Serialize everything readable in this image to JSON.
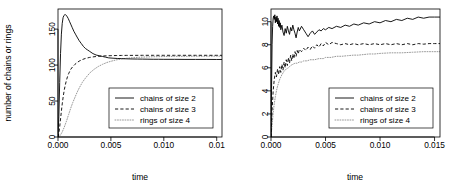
{
  "figure": {
    "panel_count": 2,
    "background": "#ffffff",
    "ink_color": "#000000",
    "dotted_color": "#8c8c8c"
  },
  "chart_data": [
    {
      "type": "line",
      "panel": "left",
      "title": "",
      "xlabel": "time",
      "ylabel": "number of chains or rings",
      "xlim": [
        0,
        0.0155
      ],
      "ylim": [
        0,
        178
      ],
      "grid": false,
      "legend_position": "center-right",
      "xticks": [
        0.0,
        0.005,
        0.01,
        0.015
      ],
      "xticklabels": [
        "0.000",
        "0.005",
        "0.010",
        "0.01"
      ],
      "yticks": [
        0,
        50,
        100,
        150
      ],
      "yticklabels": [
        "0",
        "50",
        "100",
        "150"
      ],
      "series": [
        {
          "name": "chains of size 2",
          "style": "solid",
          "x": [
            0.0,
            8e-05,
            0.00016,
            0.00024,
            0.00032,
            0.0004,
            0.00048,
            0.00056,
            0.00064,
            0.00072,
            0.0008,
            0.00088,
            0.00096,
            0.00108,
            0.0012,
            0.00135,
            0.0015,
            0.00165,
            0.0018,
            0.002,
            0.0022,
            0.0024,
            0.0026,
            0.0028,
            0.003,
            0.0033,
            0.0036,
            0.0039,
            0.0042,
            0.0045,
            0.0048,
            0.0052,
            0.0056,
            0.006,
            0.0065,
            0.007,
            0.0075,
            0.008,
            0.0085,
            0.009,
            0.0095,
            0.01,
            0.011,
            0.012,
            0.013,
            0.014,
            0.015,
            0.0155
          ],
          "y": [
            2,
            28,
            76,
            116,
            143,
            158,
            166,
            169,
            170,
            170,
            169,
            167,
            165,
            161,
            157,
            152,
            147,
            143,
            139,
            134,
            130,
            126,
            123,
            121,
            119,
            116,
            114,
            113,
            112,
            111,
            110,
            109.6,
            109.2,
            109.0,
            108.7,
            108.5,
            108.4,
            108.3,
            108.2,
            108.1,
            108.1,
            108.0,
            108.0,
            107.9,
            107.9,
            107.9,
            107.8,
            107.8
          ]
        },
        {
          "name": "chains of size 3",
          "style": "dashed",
          "x": [
            0.0,
            8e-05,
            0.00016,
            0.00024,
            0.00032,
            0.0004,
            0.0005,
            0.0006,
            0.0007,
            0.0008,
            0.0009,
            0.001,
            0.0012,
            0.0014,
            0.0016,
            0.0018,
            0.002,
            0.0023,
            0.0026,
            0.003,
            0.0034,
            0.0038,
            0.0042,
            0.0046,
            0.005,
            0.0055,
            0.006,
            0.0065,
            0.007,
            0.008,
            0.009,
            0.01,
            0.011,
            0.012,
            0.013,
            0.014,
            0.015,
            0.0155
          ],
          "y": [
            0,
            5,
            14,
            25,
            36,
            46,
            57,
            66,
            73,
            79,
            84,
            88,
            94,
            98,
            101,
            103.5,
            105.5,
            107.7,
            109.3,
            110.7,
            111.6,
            112.2,
            112.6,
            112.9,
            113.1,
            113.3,
            113.4,
            113.5,
            113.5,
            113.6,
            113.6,
            113.6,
            113.6,
            113.6,
            113.6,
            113.6,
            113.6,
            113.6
          ]
        },
        {
          "name": "rings of size 4",
          "style": "dotted",
          "x": [
            0.0,
            0.0002,
            0.0004,
            0.0006,
            0.0008,
            0.001,
            0.0012,
            0.0014,
            0.0016,
            0.0018,
            0.002,
            0.0023,
            0.0026,
            0.003,
            0.0034,
            0.0038,
            0.0042,
            0.0046,
            0.005,
            0.0055,
            0.006,
            0.0065,
            0.007,
            0.0076,
            0.008,
            0.009,
            0.01,
            0.011,
            0.012,
            0.013,
            0.014,
            0.015,
            0.0155
          ],
          "y": [
            0,
            2,
            7,
            14,
            22,
            31,
            40,
            48,
            55,
            62,
            68,
            76,
            82,
            89,
            94,
            98,
            101,
            103.5,
            105.3,
            107.2,
            108.5,
            109.5,
            110.2,
            110.8,
            111.1,
            111.6,
            111.9,
            112.1,
            112.2,
            112.3,
            112.3,
            112.4,
            112.4
          ]
        }
      ],
      "legend": [
        {
          "label": "chains of size 2",
          "style": "solid"
        },
        {
          "label": "chains of size 3",
          "style": "dashed"
        },
        {
          "label": "rings of size 4",
          "style": "dotted"
        }
      ]
    },
    {
      "type": "line",
      "panel": "right",
      "title": "",
      "xlabel": "time",
      "ylabel": "",
      "xlim": [
        0,
        0.0155
      ],
      "ylim": [
        0,
        11.1
      ],
      "grid": false,
      "legend_position": "center-right",
      "xticks": [
        0.0,
        0.005,
        0.01,
        0.015
      ],
      "xticklabels": [
        "0.000",
        "0.005",
        "0.010",
        "0.015"
      ],
      "yticks": [
        0,
        2,
        4,
        6,
        8,
        10
      ],
      "yticklabels": [
        "0",
        "2",
        "4",
        "6",
        "8",
        "10"
      ],
      "series": [
        {
          "name": "chains of size 2",
          "style": "solid",
          "x": [
            0.0,
            5e-05,
            0.0001,
            0.00015,
            0.0002,
            0.00025,
            0.0003,
            0.00035,
            0.0004,
            0.00045,
            0.0005,
            0.00055,
            0.0006,
            0.00065,
            0.0007,
            0.00075,
            0.0008,
            0.00085,
            0.0009,
            0.001,
            0.0011,
            0.0012,
            0.0013,
            0.0014,
            0.0015,
            0.0016,
            0.0017,
            0.0018,
            0.0019,
            0.002,
            0.0021,
            0.0022,
            0.0023,
            0.0024,
            0.0025,
            0.0026,
            0.0028,
            0.003,
            0.0032,
            0.0034,
            0.0036,
            0.0038,
            0.004,
            0.0042,
            0.0044,
            0.0046,
            0.0048,
            0.005,
            0.0053,
            0.0056,
            0.006,
            0.0064,
            0.0068,
            0.0072,
            0.0076,
            0.008,
            0.0085,
            0.009,
            0.0095,
            0.01,
            0.0105,
            0.011,
            0.0115,
            0.012,
            0.0125,
            0.013,
            0.0135,
            0.014,
            0.0145,
            0.015,
            0.0155
          ],
          "y": [
            0,
            4.2,
            8.0,
            9.6,
            10.3,
            10.5,
            10.2,
            10.6,
            9.9,
            10.4,
            10.0,
            10.5,
            9.8,
            10.3,
            9.6,
            10.1,
            9.5,
            9.9,
            9.3,
            9.7,
            9.1,
            8.8,
            9.4,
            9.0,
            9.6,
            9.2,
            8.9,
            9.5,
            9.2,
            9.7,
            9.3,
            9.0,
            8.6,
            9.1,
            9.5,
            9.2,
            9.6,
            9.3,
            9.0,
            8.7,
            9.0,
            9.2,
            8.9,
            9.1,
            9.3,
            9.2,
            9.4,
            9.3,
            9.5,
            9.4,
            9.6,
            9.5,
            9.7,
            9.6,
            9.8,
            9.7,
            9.9,
            9.8,
            10.0,
            9.9,
            10.1,
            10.0,
            10.2,
            10.1,
            10.3,
            10.2,
            10.4,
            10.3,
            10.4,
            10.4,
            10.4
          ]
        },
        {
          "name": "chains of size 3",
          "style": "dashed",
          "x": [
            0.0,
            0.0001,
            0.0002,
            0.0003,
            0.0004,
            0.0005,
            0.0006,
            0.0007,
            0.0008,
            0.0009,
            0.001,
            0.0011,
            0.0012,
            0.0013,
            0.0014,
            0.0015,
            0.0016,
            0.0017,
            0.0018,
            0.0019,
            0.002,
            0.0021,
            0.0022,
            0.0023,
            0.0024,
            0.0025,
            0.0026,
            0.0028,
            0.003,
            0.0032,
            0.0034,
            0.0036,
            0.0038,
            0.004,
            0.0042,
            0.0044,
            0.0046,
            0.0048,
            0.005,
            0.0053,
            0.0056,
            0.006,
            0.0064,
            0.0068,
            0.0072,
            0.0076,
            0.008,
            0.0085,
            0.009,
            0.0095,
            0.01,
            0.0105,
            0.011,
            0.0115,
            0.012,
            0.0125,
            0.013,
            0.0135,
            0.014,
            0.0145,
            0.015,
            0.0155
          ],
          "y": [
            0,
            2.3,
            4.0,
            5.0,
            5.6,
            5.2,
            5.9,
            5.4,
            6.1,
            5.6,
            6.3,
            5.8,
            6.5,
            6.0,
            6.7,
            6.2,
            6.9,
            6.4,
            7.1,
            6.6,
            7.2,
            6.8,
            7.4,
            7.0,
            7.5,
            7.2,
            7.6,
            7.4,
            7.7,
            7.5,
            7.8,
            7.6,
            7.9,
            7.7,
            8.0,
            7.8,
            8.1,
            7.9,
            8.2,
            8.0,
            8.2,
            8.1,
            8.0,
            8.1,
            8.0,
            8.1,
            8.0,
            8.1,
            8.0,
            8.1,
            8.0,
            8.1,
            8.0,
            8.1,
            8.0,
            8.1,
            8.0,
            8.1,
            8.05,
            8.1,
            8.1,
            8.1
          ]
        },
        {
          "name": "rings of size 4",
          "style": "dotted",
          "x": [
            0.0,
            0.0001,
            0.0002,
            0.0003,
            0.0004,
            0.0005,
            0.0006,
            0.0007,
            0.0008,
            0.0009,
            0.001,
            0.0012,
            0.0014,
            0.0016,
            0.0018,
            0.002,
            0.0022,
            0.0024,
            0.0026,
            0.0028,
            0.003,
            0.0033,
            0.0036,
            0.004,
            0.0044,
            0.0048,
            0.005,
            0.0055,
            0.006,
            0.0065,
            0.007,
            0.0076,
            0.008,
            0.0085,
            0.009,
            0.0095,
            0.01,
            0.011,
            0.012,
            0.013,
            0.014,
            0.015,
            0.0155
          ],
          "y": [
            0,
            1.0,
            2.1,
            2.9,
            3.5,
            4.0,
            4.4,
            4.7,
            5.0,
            5.2,
            5.4,
            5.7,
            5.9,
            6.0,
            6.2,
            6.3,
            6.4,
            6.4,
            6.5,
            6.5,
            6.6,
            6.6,
            6.7,
            6.7,
            6.8,
            6.8,
            6.9,
            6.9,
            7.0,
            7.0,
            7.05,
            7.1,
            7.1,
            7.15,
            7.2,
            7.2,
            7.25,
            7.3,
            7.3,
            7.35,
            7.4,
            7.4,
            7.4
          ]
        }
      ],
      "legend": [
        {
          "label": "chains of size 2",
          "style": "solid"
        },
        {
          "label": "chains of size 3",
          "style": "dashed"
        },
        {
          "label": "rings of size 4",
          "style": "dotted"
        }
      ]
    }
  ]
}
